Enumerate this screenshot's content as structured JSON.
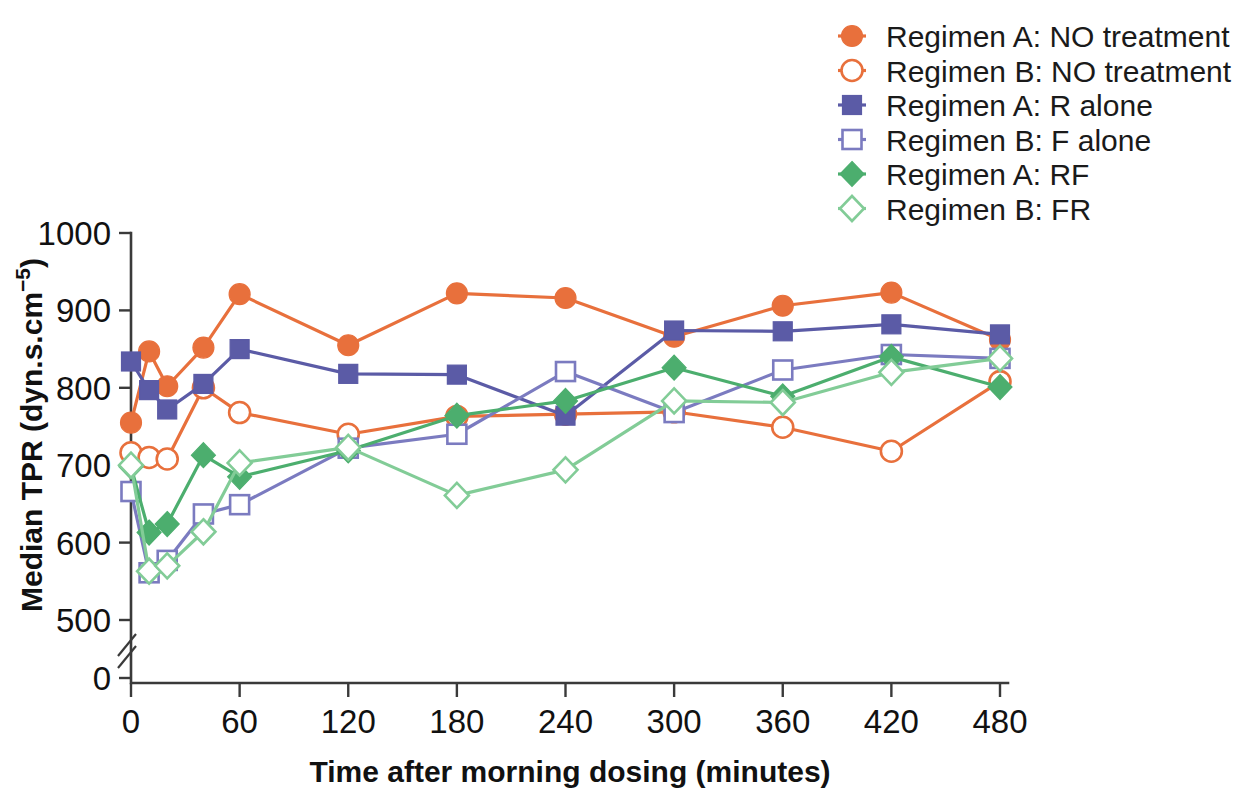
{
  "chart_data": {
    "type": "line",
    "title": "",
    "xlabel": "Time after morning dosing (minutes)",
    "ylabel": "Median TPR (dyn.s.cm⁻⁵)",
    "xlim": [
      0,
      480
    ],
    "ylim": [
      500,
      1000
    ],
    "y_axis_break": true,
    "y_zero_tick": "0",
    "grid": false,
    "legend_position": "top-right",
    "xticks": [
      0,
      60,
      120,
      180,
      240,
      300,
      360,
      420,
      480
    ],
    "xtick_labels": [
      "0",
      "60",
      "120",
      "180",
      "240",
      "300",
      "360",
      "420",
      "480"
    ],
    "yticks": [
      500,
      600,
      700,
      800,
      900,
      1000
    ],
    "ytick_labels": [
      "500",
      "600",
      "700",
      "800",
      "900",
      "1000"
    ],
    "x": [
      0,
      10,
      20,
      40,
      60,
      120,
      180,
      240,
      300,
      360,
      420,
      480
    ],
    "series": [
      {
        "name": "Regimen A: NO treatment",
        "color": "#E8703C",
        "marker": "circle",
        "fill": "solid",
        "values": [
          755,
          847,
          802,
          852,
          921,
          855,
          922,
          916,
          866,
          906,
          923,
          862
        ]
      },
      {
        "name": "Regimen B: NO treatment",
        "color": "#E8703C",
        "marker": "circle",
        "fill": "open",
        "values": [
          716,
          710,
          708,
          800,
          768,
          740,
          763,
          766,
          769,
          749,
          718,
          808
        ]
      },
      {
        "name": "Regimen A: R alone",
        "color": "#5B5BA6",
        "marker": "square",
        "fill": "solid",
        "values": [
          834,
          797,
          772,
          805,
          850,
          818,
          817,
          764,
          874,
          873,
          882,
          869
        ]
      },
      {
        "name": "Regimen B: F alone",
        "color": "#7B7BC0",
        "marker": "square",
        "fill": "open",
        "values": [
          666,
          561,
          577,
          637,
          649,
          722,
          740,
          821,
          768,
          823,
          843,
          838
        ]
      },
      {
        "name": "Regimen A: RF",
        "color": "#4CAE6E",
        "marker": "diamond",
        "fill": "solid",
        "values": [
          698,
          613,
          624,
          713,
          685,
          719,
          764,
          783,
          826,
          789,
          840,
          801
        ]
      },
      {
        "name": "Regimen B: FR",
        "color": "#82CC97",
        "marker": "diamond",
        "fill": "open",
        "values": [
          700,
          563,
          570,
          614,
          703,
          723,
          661,
          694,
          783,
          781,
          820,
          838
        ]
      }
    ]
  },
  "legend": {
    "items": [
      {
        "label": "Regimen A: NO treatment"
      },
      {
        "label": "Regimen B: NO treatment"
      },
      {
        "label": "Regimen A: R alone"
      },
      {
        "label": "Regimen B: F alone"
      },
      {
        "label": "Regimen A: RF"
      },
      {
        "label": "Regimen B: FR"
      }
    ]
  },
  "axes": {
    "x_title": "Time after morning dosing (minutes)",
    "y_title_main": "Median TPR (dyn.s.cm",
    "y_title_sup": "−5",
    "y_title_close": ")"
  },
  "colors": {
    "orange": "#E8703C",
    "purple_dark": "#5B5BA6",
    "purple_light": "#7B7BC0",
    "green_dark": "#4CAE6E",
    "green_light": "#82CC97",
    "axis": "#3a3a3a",
    "text": "#111111"
  }
}
